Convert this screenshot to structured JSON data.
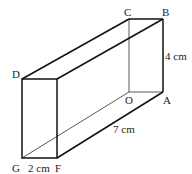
{
  "figure": {
    "type": "cuboid",
    "vertices": {
      "A": {
        "label": "A"
      },
      "B": {
        "label": "B"
      },
      "C": {
        "label": "C"
      },
      "D": {
        "label": "D"
      },
      "F": {
        "label": "F"
      },
      "G": {
        "label": "G"
      },
      "O": {
        "label": "O"
      }
    },
    "dimensions": {
      "height": "4 cm",
      "length": "7 cm",
      "width": "2 cm"
    }
  }
}
